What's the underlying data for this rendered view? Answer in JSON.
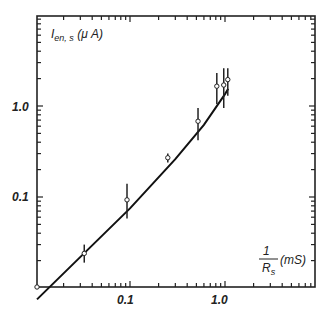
{
  "chart_data": {
    "type": "scatter",
    "title": "",
    "xlabel": "1/R_s (mS)",
    "ylabel": "I_en,s (μA)",
    "xscale": "log",
    "yscale": "log",
    "xlim": [
      0.01,
      10
    ],
    "ylim": [
      0.01,
      10
    ],
    "grid": false,
    "legend": null,
    "x_ticks": [
      {
        "value": 0.1,
        "label": "0.1"
      },
      {
        "value": 1.0,
        "label": "1.0"
      }
    ],
    "y_ticks": [
      {
        "value": 0.1,
        "label": "0.1"
      },
      {
        "value": 1.0,
        "label": "1.0"
      }
    ],
    "series": [
      {
        "name": "measured",
        "marker": "open-circle",
        "error_bars": true,
        "points": [
          {
            "x": 0.01,
            "y": 0.01,
            "err_low": 0.01,
            "err_high": 0.01
          },
          {
            "x": 0.033,
            "y": 0.024,
            "err_low": 0.019,
            "err_high": 0.03
          },
          {
            "x": 0.093,
            "y": 0.093,
            "err_low": 0.058,
            "err_high": 0.14
          },
          {
            "x": 0.25,
            "y": 0.27,
            "err_low": 0.24,
            "err_high": 0.3
          },
          {
            "x": 0.52,
            "y": 0.68,
            "err_low": 0.42,
            "err_high": 0.95
          },
          {
            "x": 0.82,
            "y": 1.65,
            "err_low": 1.05,
            "err_high": 2.3
          },
          {
            "x": 0.97,
            "y": 1.7,
            "err_low": 0.95,
            "err_high": 2.6
          },
          {
            "x": 1.07,
            "y": 1.95,
            "err_low": 1.3,
            "err_high": 2.6
          }
        ]
      },
      {
        "name": "fit",
        "type": "line",
        "points": [
          {
            "x": 0.0105,
            "y": 0.0075
          },
          {
            "x": 0.1,
            "y": 0.075
          },
          {
            "x": 0.3,
            "y": 0.26
          },
          {
            "x": 0.6,
            "y": 0.62
          },
          {
            "x": 1.0,
            "y": 1.35
          },
          {
            "x": 1.08,
            "y": 1.55
          }
        ]
      }
    ]
  },
  "labels": {
    "y_axis_main": "I",
    "y_axis_sub": "en, s",
    "y_axis_unit": " (μ A)",
    "x_axis_num": "1",
    "x_axis_den_main": "R",
    "x_axis_den_sub": "s",
    "x_axis_unit": "(mS)",
    "x_tick_0": "0.1",
    "x_tick_1": "1.0",
    "y_tick_0": "0.1",
    "y_tick_1": "1.0"
  }
}
